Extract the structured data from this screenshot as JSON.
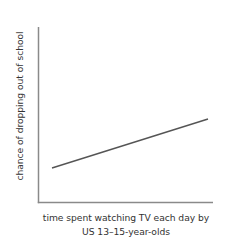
{
  "chart_data": {
    "type": "line",
    "title": "",
    "subtitle": "",
    "xlabel_lines": [
      "time spent watching TV each day by",
      "US 13–15-year-olds"
    ],
    "xlabel": "time spent watching TV each day by US 13–15-year-olds",
    "ylabel": "chance of dropping out of school",
    "xticklabels": [],
    "yticklabels": [],
    "grid": false,
    "legend": false,
    "legend_position": "none",
    "annotations": [],
    "axis_style": {
      "spines": [
        "left",
        "bottom"
      ],
      "ticks": "none",
      "axis_color": "#8a8a8a",
      "axis_width_px": 1.5
    },
    "axis_extent_px": {
      "x_start": 38,
      "x_end": 213,
      "y_top": 27,
      "y_bottom": 203
    },
    "series": [
      {
        "name": "trend",
        "kind": "line",
        "color": "#555555",
        "width_px": 1.4,
        "description": "straight upward-sloping trend line showing positive association",
        "x": [
          0.08,
          0.97
        ],
        "y": [
          0.2,
          0.48
        ],
        "points_px": [
          {
            "x": 52,
            "y": 168
          },
          {
            "x": 208,
            "y": 119
          }
        ]
      }
    ],
    "xlim": [
      0,
      1
    ],
    "ylim": [
      0,
      1
    ]
  },
  "figure": {
    "background": "#ffffff",
    "text_color": "#333333",
    "width_px": 230,
    "height_px": 249
  }
}
